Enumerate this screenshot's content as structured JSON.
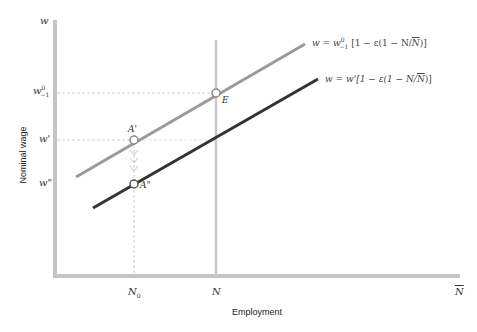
{
  "axes": {
    "y_label": "Nominal wage",
    "x_label": "Employment",
    "y_axis_symbol": "w",
    "y_ticks": [
      {
        "label": "w⁰₋₁",
        "base": "w",
        "sup": "0",
        "sub": "−1",
        "y": 93
      },
      {
        "label": "w'",
        "base": "w'",
        "y": 140
      },
      {
        "label": "w\"",
        "base": "w\"",
        "y": 184
      }
    ],
    "x_ticks": [
      {
        "label": "N₀",
        "base": "N",
        "sub": "0",
        "x": 134
      },
      {
        "label": "N",
        "base": "N",
        "x": 216
      },
      {
        "label": "N̄",
        "base": "N",
        "overline": true,
        "x": 459
      }
    ]
  },
  "curves": [
    {
      "name": "upper-wage-curve",
      "equation": "w = w⁰₋₁ [1 − ε(1 − N/N̄)]",
      "color": "#9a9a9a"
    },
    {
      "name": "lower-wage-curve",
      "equation": "w = w'[1 − ε(1 − N/N̄)]",
      "color": "#333333"
    }
  ],
  "points": [
    {
      "label": "E",
      "x": 216,
      "y": 93
    },
    {
      "label": "A'",
      "x": 134,
      "y": 140
    },
    {
      "label": "A\"",
      "x": 134,
      "y": 184
    }
  ],
  "eq_parts": {
    "upper_prefix": "w = w",
    "upper_sup": "0",
    "upper_sub": "−1",
    "upper_suffix": " [1 − ε(1 − N/",
    "upper_nbar": "N",
    "upper_close": ")]",
    "lower_prefix": "w = w'[1 − ε(1 − N/",
    "lower_nbar": "N",
    "lower_close": ")]"
  }
}
